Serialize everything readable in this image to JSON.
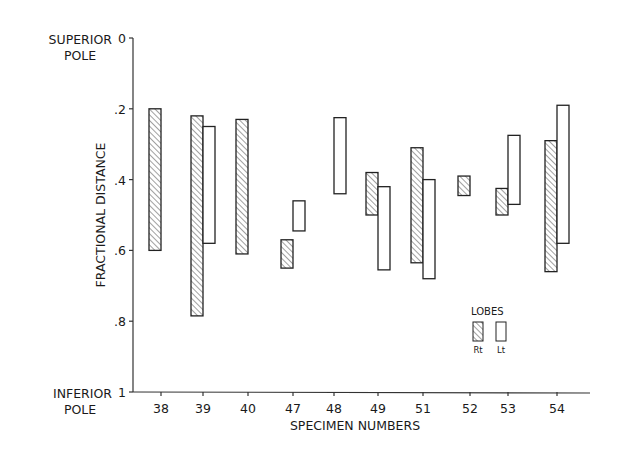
{
  "chart_data": {
    "type": "bar",
    "subtype": "floating-range-bar",
    "title": "",
    "xlabel": "SPECIMEN NUMBERS",
    "ylabel": "FRACTIONAL DISTANCE",
    "y_top_label": [
      "SUPERIOR",
      "POLE"
    ],
    "y_bottom_label": [
      "INFERIOR",
      "POLE"
    ],
    "ylim": [
      0,
      1
    ],
    "y_inverted": true,
    "y_ticks": [
      {
        "value": 0,
        "label": "0"
      },
      {
        "value": 0.2,
        "label": ".2"
      },
      {
        "value": 0.4,
        "label": ".4"
      },
      {
        "value": 0.6,
        "label": ".6"
      },
      {
        "value": 0.8,
        "label": ".8"
      },
      {
        "value": 1,
        "label": "1"
      }
    ],
    "grid": false,
    "categories": [
      "38",
      "39",
      "40",
      "47",
      "48",
      "49",
      "51",
      "52",
      "53",
      "54"
    ],
    "series": [
      {
        "name": "Rt",
        "pattern": "hatched",
        "ranges": [
          [
            0.2,
            0.6
          ],
          [
            0.22,
            0.785
          ],
          [
            0.23,
            0.61
          ],
          [
            0.57,
            0.65
          ],
          null,
          [
            0.38,
            0.5
          ],
          [
            0.31,
            0.635
          ],
          [
            0.39,
            0.445
          ],
          [
            0.425,
            0.5
          ],
          [
            0.29,
            0.66
          ]
        ]
      },
      {
        "name": "Lt",
        "pattern": "open",
        "ranges": [
          null,
          [
            0.25,
            0.58
          ],
          null,
          [
            0.46,
            0.545
          ],
          [
            0.225,
            0.44
          ],
          [
            0.42,
            0.655
          ],
          [
            0.4,
            0.68
          ],
          null,
          [
            0.275,
            0.47
          ],
          [
            0.19,
            0.58
          ]
        ]
      }
    ],
    "legend": {
      "title": "LOBES",
      "position": "lower-right",
      "entries": [
        {
          "label": "Rt",
          "pattern": "hatched"
        },
        {
          "label": "Lt",
          "pattern": "open"
        }
      ]
    }
  }
}
